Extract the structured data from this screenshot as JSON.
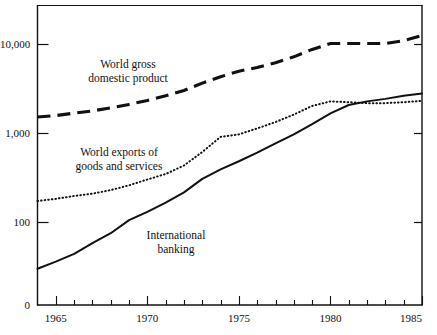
{
  "chart_data": {
    "type": "line",
    "title": "",
    "subtitle": "",
    "xlabel": "",
    "ylabel": "",
    "scale": "log",
    "grid": false,
    "legend_position": "inline-annotations",
    "xlim": [
      1964,
      1985
    ],
    "ylim": [
      20,
      20000
    ],
    "y_tick_labels": [
      "10,000",
      "1,000",
      "100",
      "0"
    ],
    "y_tick_values": [
      10000,
      1000,
      100,
      0
    ],
    "x_tick_labels": [
      "1965",
      "1970",
      "1975",
      "1980",
      "1985"
    ],
    "x_tick_values": [
      1965,
      1970,
      1975,
      1980,
      1985
    ],
    "x_minor_ticks": [
      1964,
      1965,
      1966,
      1967,
      1968,
      1969,
      1970,
      1971,
      1972,
      1973,
      1974,
      1975,
      1976,
      1977,
      1978,
      1979,
      1980,
      1981,
      1982,
      1983,
      1984,
      1985
    ],
    "series": [
      {
        "name": "World gross domestic product",
        "style": "dashed",
        "label_line1": "World gross",
        "label_line2": "domestic product",
        "x": [
          1964,
          1965,
          1966,
          1967,
          1968,
          1969,
          1970,
          1971,
          1972,
          1973,
          1974,
          1975,
          1976,
          1977,
          1978,
          1979,
          1980,
          1981,
          1982,
          1983,
          1984,
          1985
        ],
        "values": [
          1500,
          1560,
          1660,
          1760,
          1900,
          2080,
          2300,
          2600,
          2980,
          3600,
          4250,
          4900,
          5400,
          6100,
          7100,
          8600,
          10000,
          10000,
          10000,
          10000,
          10800,
          12300
        ]
      },
      {
        "name": "World exports of goods and services",
        "style": "dotted",
        "label_line1": "World exports of",
        "label_line2": "goods and services",
        "x": [
          1964,
          1965,
          1966,
          1967,
          1968,
          1969,
          1970,
          1971,
          1972,
          1973,
          1974,
          1975,
          1976,
          1977,
          1978,
          1979,
          1980,
          1981,
          1982,
          1983,
          1984,
          1985
        ],
        "values": [
          172,
          182,
          196,
          208,
          228,
          258,
          300,
          345,
          430,
          610,
          900,
          960,
          1120,
          1320,
          1600,
          2000,
          2250,
          2200,
          2150,
          2150,
          2200,
          2280
        ]
      },
      {
        "name": "International banking",
        "style": "solid",
        "label_line1": "International",
        "label_line2": "banking",
        "x": [
          1964,
          1965,
          1966,
          1967,
          1968,
          1969,
          1970,
          1971,
          1972,
          1973,
          1974,
          1975,
          1976,
          1977,
          1978,
          1979,
          1980,
          1981,
          1982,
          1983,
          1984,
          1985
        ],
        "values": [
          30,
          36,
          44,
          58,
          75,
          105,
          130,
          165,
          215,
          305,
          390,
          480,
          600,
          760,
          960,
          1250,
          1650,
          2050,
          2250,
          2400,
          2600,
          2750
        ]
      }
    ],
    "annotations": [
      {
        "text": "World gross domestic product",
        "series": "World gross domestic product"
      },
      {
        "text": "World exports of goods and services",
        "series": "World exports of goods and services"
      },
      {
        "text": "International banking",
        "series": "International banking"
      }
    ],
    "colors": {
      "axis": "#111111",
      "gdp_line": "#111111",
      "exports_line": "#111111",
      "banking_line": "#111111",
      "background": "#ffffff"
    }
  },
  "axis": {
    "y_labels": {
      "l10000": "10,000",
      "l1000": "1,000",
      "l100": "100",
      "l0": "0"
    },
    "x_labels": {
      "x1965": "1965",
      "x1970": "1970",
      "x1975": "1975",
      "x1980": "1980",
      "x1985": "1985"
    }
  },
  "labels": {
    "gdp_line1": "World gross",
    "gdp_line2": "domestic product",
    "exports_line1": "World exports of",
    "exports_line2": "goods and services",
    "banking_line1": "International",
    "banking_line2": "banking"
  }
}
